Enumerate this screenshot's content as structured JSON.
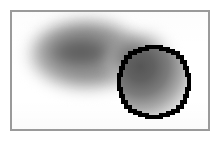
{
  "figure": {
    "caption": "",
    "width_px": 220,
    "height_px": 142,
    "background_color": "#ffffff"
  },
  "frame": {
    "border_color": "#9a9a9a",
    "border_width_px": 2,
    "fill_color": "#ffffff",
    "left_px": 10,
    "top_px": 10,
    "width_px": 200,
    "height_px": 121
  },
  "blob": {
    "label": "blurred-gray-blob",
    "shape": "elongated-ellipse",
    "core_color": "#5f5f5f",
    "mid_color": "#8a8a8a",
    "edge_color": "#e2e2e2",
    "blur_radius_px": 6,
    "center_x_px": 72,
    "center_y_px": 50,
    "width_px": 128,
    "height_px": 92
  },
  "roi": {
    "label": "region-of-interest-circle",
    "outline_color": "#000000",
    "outline_width_px": 3,
    "style": "jagged-aliased",
    "center_x_px": 155,
    "center_y_px": 82,
    "radius_px": 35,
    "fill": "none",
    "interior_gradient_from": "#5e5e5e",
    "interior_gradient_to": "#ffffff"
  },
  "annotations": {
    "title": "",
    "subtitle": "",
    "legend": []
  }
}
